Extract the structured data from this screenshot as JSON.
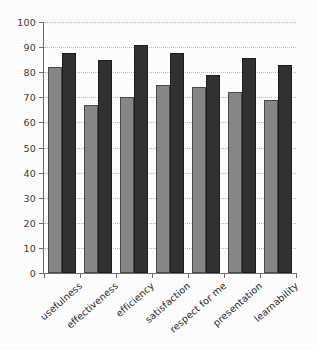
{
  "chart_data": {
    "type": "bar",
    "title": "",
    "subtitle": "",
    "xlabel": "",
    "ylabel": "",
    "ylim": [
      0,
      100
    ],
    "yticks": [
      0,
      10,
      20,
      30,
      40,
      50,
      60,
      70,
      80,
      90,
      100
    ],
    "grid": true,
    "legend": "none",
    "orientation": "vertical",
    "grouping": "clustered",
    "categories": [
      "usefulness",
      "effectiveness",
      "efficiency",
      "satisfaction",
      "respect for me",
      "presentation",
      "learnability"
    ],
    "series": [
      {
        "name": "series-1",
        "color": "#868686",
        "values": [
          82,
          67,
          70,
          75,
          74,
          72,
          69
        ]
      },
      {
        "name": "series-2",
        "color": "#313131",
        "values": [
          87.5,
          85,
          91,
          87.5,
          79,
          85.5,
          83
        ]
      }
    ]
  },
  "axis": {
    "y_tick_labels": [
      "0",
      "10",
      "20",
      "30",
      "40",
      "50",
      "60",
      "70",
      "80",
      "90",
      "100"
    ]
  },
  "colors": {
    "series_light": "#868686",
    "series_dark": "#313131",
    "gridline": "#b9b9c2",
    "axis": "#6d6d6d",
    "background": "#fdfdfd",
    "text": "#2b2b2b"
  }
}
